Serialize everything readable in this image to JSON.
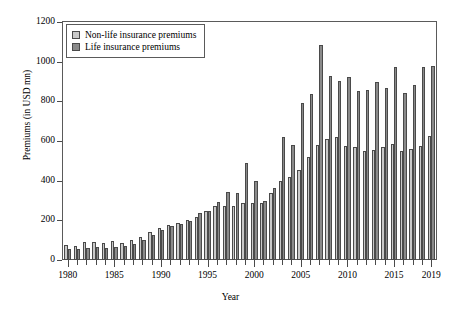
{
  "chart_data": {
    "type": "bar",
    "title": "",
    "xlabel": "Year",
    "ylabel": "Premiums (in USD mn)",
    "xlim": [
      1979.5,
      2019.5
    ],
    "ylim": [
      0,
      1200
    ],
    "ytick_values": [
      0,
      200,
      400,
      600,
      800,
      1000,
      1200
    ],
    "ytick_labels": [
      "0",
      "200",
      "400",
      "600",
      "800",
      "1000",
      "1200"
    ],
    "xtick_labels": [
      "1980",
      "1985",
      "1990",
      "1995",
      "2000",
      "2005",
      "2010",
      "2015",
      "2019"
    ],
    "xtick_values": [
      1980,
      1985,
      1990,
      1995,
      2000,
      2005,
      2010,
      2015,
      2019
    ],
    "grid": false,
    "legend_position": "upper left",
    "colors": {
      "nonlife": "#c9c9c9",
      "life": "#8a8a8a",
      "outline": "#4a4a4a"
    },
    "categories": [
      1980,
      1981,
      1982,
      1983,
      1984,
      1985,
      1986,
      1987,
      1988,
      1989,
      1990,
      1991,
      1992,
      1993,
      1994,
      1995,
      1996,
      1997,
      1998,
      1999,
      2000,
      2001,
      2002,
      2003,
      2004,
      2005,
      2006,
      2007,
      2008,
      2009,
      2010,
      2011,
      2012,
      2013,
      2014,
      2015,
      2016,
      2017,
      2018,
      2019
    ],
    "series": [
      {
        "name": "Non-life insurance premiums",
        "color": "#c9c9c9",
        "values": [
          78,
          72,
          90,
          93,
          85,
          98,
          85,
          100,
          118,
          140,
          160,
          175,
          185,
          200,
          215,
          245,
          270,
          272,
          272,
          285,
          285,
          285,
          340,
          400,
          420,
          455,
          520,
          580,
          610,
          618,
          575,
          570,
          550,
          555,
          570,
          585,
          548,
          560,
          575,
          625
        ]
      },
      {
        "name": "Life insurance premiums",
        "color": "#8a8a8a",
        "values": [
          58,
          55,
          62,
          68,
          60,
          65,
          72,
          82,
          100,
          125,
          150,
          170,
          180,
          195,
          235,
          245,
          290,
          345,
          340,
          490,
          400,
          300,
          365,
          620,
          580,
          790,
          835,
          1085,
          930,
          905,
          925,
          850,
          855,
          900,
          865,
          975,
          840,
          880,
          975,
          980
        ]
      }
    ]
  },
  "legend": {
    "items": [
      {
        "label": "Non-life insurance premiums",
        "key": "nonlife"
      },
      {
        "label": "Life insurance premiums",
        "key": "life"
      }
    ]
  },
  "axes": {
    "x_title": "Year",
    "y_title": "Premiums (in USD mn)"
  }
}
